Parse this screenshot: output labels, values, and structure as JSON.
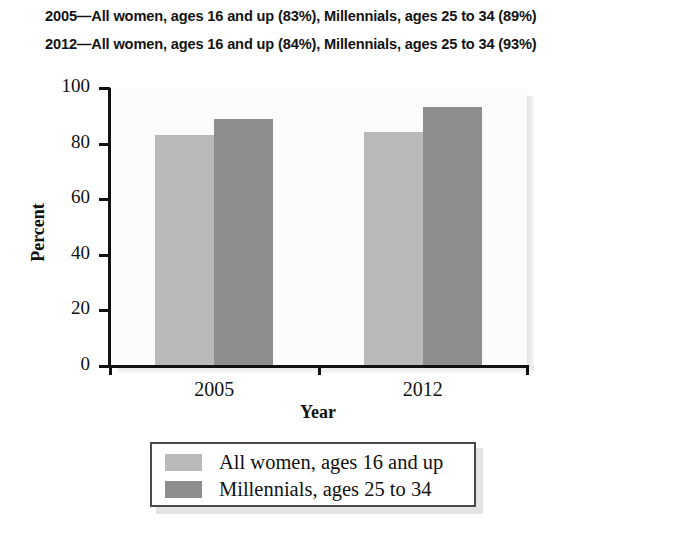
{
  "caption": {
    "line1": "2005—All women, ages 16 and up (83%), Millennials, ages 25 to 34 (89%)",
    "line2": "2012—All women, ages 16 and up (84%), Millennials, ages 25 to 34 (93%)"
  },
  "chart_data": {
    "type": "bar",
    "title": "",
    "categories": [
      "2005",
      "2012"
    ],
    "series": [
      {
        "name": "All women, ages 16 and up",
        "values": [
          83,
          84
        ],
        "color": "#b9b9b9"
      },
      {
        "name": "Millennials, ages 25 to 34",
        "values": [
          89,
          93
        ],
        "color": "#8e8e8e"
      }
    ],
    "xlabel": "Year",
    "ylabel": "Percent",
    "ylim": [
      0,
      100
    ],
    "yticks": [
      0,
      20,
      40,
      60,
      80,
      100
    ],
    "ytick_labels": [
      "0",
      "20",
      "40",
      "60",
      "80",
      "100"
    ],
    "grid": false,
    "legend_position": "below-center",
    "legend_entries": [
      "All women, ages 16 and up",
      "Millennials, ages 25 to 34"
    ]
  },
  "colors": {
    "series_light": "#b9b9b9",
    "series_dark": "#8e8e8e",
    "axis": "#111111",
    "panel_background": "#fbfbfb",
    "legend_border": "#4a4a4a"
  }
}
